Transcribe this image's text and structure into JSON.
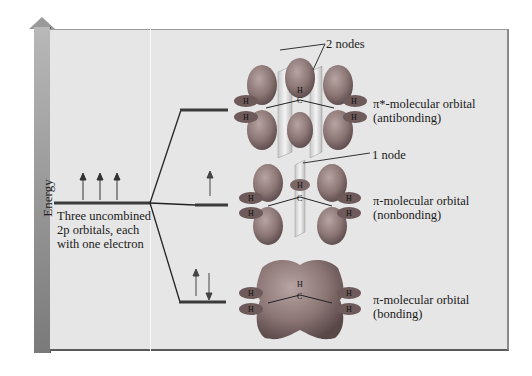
{
  "axis": {
    "label": "Energy"
  },
  "left_level": {
    "caption_lines": [
      "Three uncombined",
      "2p orbitals, each",
      "with one electron"
    ],
    "electrons": 3
  },
  "orbitals": [
    {
      "name": "antibonding",
      "title": "π*-molecular orbital",
      "subtitle": "(antibonding)",
      "node_label": "2 nodes",
      "electrons": 0
    },
    {
      "name": "nonbonding",
      "title": "π-molecular orbital",
      "subtitle": "(nonbonding)",
      "node_label": "1 node",
      "electrons": 1
    },
    {
      "name": "bonding",
      "title": "π-molecular orbital",
      "subtitle": "(bonding)",
      "node_label": "",
      "electrons": 2
    }
  ],
  "atom_labels": {
    "carbon": "C",
    "hydrogen": "H"
  },
  "colors": {
    "panel": "#e6e6e6",
    "lobe_dark": "#6e5a5a",
    "lobe_light": "#a08c8c",
    "level": "#3a3a3a"
  }
}
